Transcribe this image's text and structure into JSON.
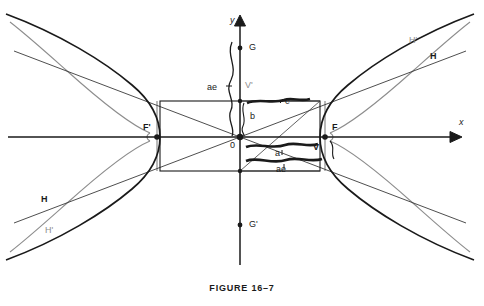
{
  "figure": {
    "caption": "FIGURE 16–7"
  },
  "axes": {
    "x_label": "x",
    "y_label": "y",
    "origin_label": "0",
    "x_axis_y": 137,
    "y_axis_x": 240,
    "x_axis_from": 8,
    "x_axis_to": 455,
    "y_axis_from": 265,
    "y_axis_to": 18
  },
  "points": [
    {
      "name": "focus-left",
      "label": "F'",
      "x": 157,
      "y": 137,
      "label_dx": -14,
      "label_dy": -12,
      "style": "bold",
      "dot": true
    },
    {
      "name": "focus-right",
      "label": "F",
      "x": 325,
      "y": 137,
      "label_dx": 7,
      "label_dy": -12,
      "style": "bold",
      "dot": true
    },
    {
      "name": "vertex-upper",
      "label": "V'",
      "x": 240,
      "y": 101,
      "label_dx": 5,
      "label_dy": -14,
      "style": "gray",
      "dot": false
    },
    {
      "name": "vertex-lower",
      "label": "V",
      "x": 320,
      "y": 146,
      "label_dx": 0,
      "label_dy": 0,
      "style": "bold",
      "dot": false
    },
    {
      "name": "point-g",
      "label": "G",
      "x": 240,
      "y": 48,
      "label_dx": 7,
      "label_dy": -5,
      "style": "plain",
      "dot": true
    },
    {
      "name": "point-g-prime",
      "label": "G'",
      "x": 240,
      "y": 225,
      "label_dx": 7,
      "label_dy": -5,
      "style": "plain",
      "dot": true
    }
  ],
  "segment_labels": [
    {
      "name": "label-ae-upper",
      "text": "ae",
      "x": 208,
      "y": 86
    },
    {
      "name": "label-ae-lower",
      "text": "ae",
      "x": 277,
      "y": 168
    },
    {
      "name": "label-b",
      "text": "b",
      "x": 251,
      "y": 115
    },
    {
      "name": "label-c",
      "text": "c",
      "x": 288,
      "y": 101
    },
    {
      "name": "label-a",
      "text": "a",
      "x": 276,
      "y": 152
    }
  ],
  "curve_labels": [
    {
      "name": "curve-label-h-upper-right",
      "text": "H",
      "x": 432,
      "y": 56,
      "style": "bold"
    },
    {
      "name": "curve-label-h-prime-upper-right",
      "text": "H'",
      "x": 411,
      "y": 40,
      "style": "gray"
    },
    {
      "name": "curve-label-h-lower-left",
      "text": "H",
      "x": 43,
      "y": 199,
      "style": "bold"
    },
    {
      "name": "curve-label-h-prime-lower-left",
      "text": "H'",
      "x": 47,
      "y": 230,
      "style": "gray"
    }
  ],
  "rectangle": {
    "name": "central-rectangle",
    "left": 160,
    "top": 101,
    "right": 320,
    "bottom": 171
  },
  "colors": {
    "ink": "#1a1a1a",
    "gray_curve": "#8d8d8d",
    "thin_line": "#3a3a3a",
    "background": "#ffffff"
  }
}
